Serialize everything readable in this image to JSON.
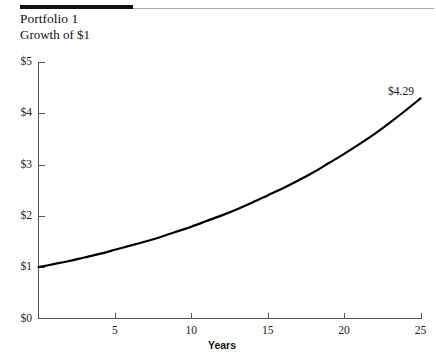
{
  "header": {
    "title": "Portfolio 1",
    "subtitle": "Growth of $1"
  },
  "chart_data": {
    "type": "line",
    "title": "Portfolio 1",
    "subtitle": "Growth of $1",
    "xlabel": "Years",
    "ylabel": "",
    "xlim": [
      0,
      25
    ],
    "ylim": [
      0,
      5
    ],
    "grid": false,
    "legend": "none",
    "x_ticks": [
      5,
      10,
      15,
      20,
      25
    ],
    "x_tick_labels": [
      "5",
      "10",
      "15",
      "20",
      "25"
    ],
    "y_ticks": [
      0,
      1,
      2,
      3,
      4,
      5
    ],
    "y_tick_labels": [
      "$0",
      "$1",
      "$2",
      "$3",
      "$4",
      "$5"
    ],
    "annotations": [
      {
        "text": "$4.29",
        "x": 25,
        "y": 4.29
      }
    ],
    "series": [
      {
        "name": "Growth of $1",
        "color": "#000000",
        "x": [
          0,
          1,
          2,
          3,
          4,
          5,
          6,
          7,
          8,
          9,
          10,
          11,
          12,
          13,
          14,
          15,
          16,
          17,
          18,
          19,
          20,
          21,
          22,
          23,
          24,
          25
        ],
        "values": [
          1.0,
          1.06,
          1.12,
          1.19,
          1.26,
          1.34,
          1.42,
          1.5,
          1.59,
          1.69,
          1.79,
          1.9,
          2.01,
          2.13,
          2.26,
          2.4,
          2.54,
          2.69,
          2.85,
          3.03,
          3.21,
          3.4,
          3.6,
          3.82,
          4.05,
          4.29
        ]
      }
    ]
  },
  "axis_title": "Years",
  "endpoint_label": "$4.29"
}
